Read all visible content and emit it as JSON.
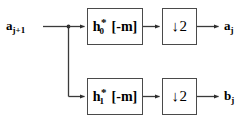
{
  "diagram": {
    "colors": {
      "stroke": "#4a4a4a",
      "wire": "#3a3a3a",
      "text": "#000000",
      "background": "#ffffff"
    },
    "input": {
      "name": "input-signal",
      "base": "a",
      "subscript": "j+1"
    },
    "branches": [
      {
        "name": "lowpass-branch",
        "filter": {
          "base": "h",
          "subscript": "0",
          "superscript": "*",
          "argument": "[-m]"
        },
        "downsampler": {
          "label": "↓2",
          "factor": "2",
          "arrow": "↓"
        },
        "output": {
          "base": "a",
          "subscript": "j"
        }
      },
      {
        "name": "highpass-branch",
        "filter": {
          "base": "h",
          "subscript": "1",
          "superscript": "*",
          "argument": "[-m]"
        },
        "downsampler": {
          "label": "↓2",
          "factor": "2",
          "arrow": "↓"
        },
        "output": {
          "base": "b",
          "subscript": "j"
        }
      }
    ]
  }
}
